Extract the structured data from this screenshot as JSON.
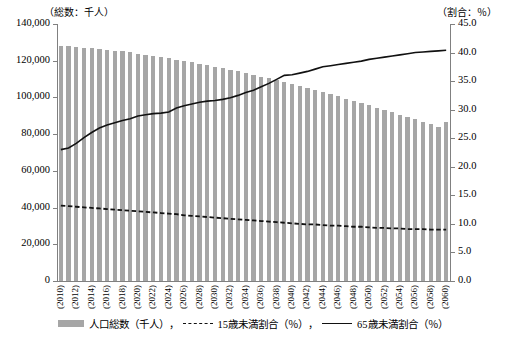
{
  "axes": {
    "left_unit": "（総数：千人）",
    "right_unit": "（割合：％）",
    "left_ticks": [
      "140,000",
      "120,000",
      "100,000",
      "80,000",
      "60,000",
      "40,000",
      "20,000",
      "0"
    ],
    "right_ticks": [
      "45.0",
      "40.0",
      "35.0",
      "30.0",
      "25.0",
      "20.0",
      "15.0",
      "10.0",
      "5.0",
      "0.0"
    ]
  },
  "legend": {
    "items": [
      {
        "label": "人口総数（千人）",
        "marker": "bar-swatch-icon"
      },
      {
        "label": "15歳未満割合（％）",
        "marker": "dashed-line-icon"
      },
      {
        "label": "65歳未満割合（％）",
        "marker": "solid-line-icon"
      }
    ],
    "separator": "，"
  },
  "chart_data": {
    "type": "bar",
    "title": "",
    "xlabel": "",
    "ylabel": "総数：千人",
    "y2label": "割合：％",
    "ylim": [
      0,
      140000
    ],
    "y2lim": [
      0,
      45
    ],
    "grid": false,
    "legend_position": "bottom",
    "x": [
      2010,
      2011,
      2012,
      2013,
      2014,
      2015,
      2016,
      2017,
      2018,
      2019,
      2020,
      2021,
      2022,
      2023,
      2024,
      2025,
      2026,
      2027,
      2028,
      2029,
      2030,
      2031,
      2032,
      2033,
      2034,
      2035,
      2036,
      2037,
      2038,
      2039,
      2040,
      2041,
      2042,
      2043,
      2044,
      2045,
      2046,
      2047,
      2048,
      2049,
      2050,
      2051,
      2052,
      2053,
      2054,
      2055,
      2056,
      2057,
      2058,
      2059,
      2060
    ],
    "tick_labels": [
      "(2010)",
      "(2012)",
      "(2014)",
      "(2016)",
      "(2018)",
      "(2020)",
      "(2022)",
      "(2024)",
      "(2026)",
      "(2028)",
      "(2030)",
      "(2032)",
      "(2034)",
      "(2036)",
      "(2038)",
      "(2040)",
      "(2042)",
      "(2044)",
      "(2046)",
      "(2048)",
      "(2050)",
      "(2052)",
      "(2054)",
      "(2056)",
      "(2058)",
      "(2060)"
    ],
    "series": [
      {
        "name": "人口総数（千人）",
        "type": "bar",
        "axis": "left",
        "color": "#a6a6a6",
        "values": [
          128057,
          127799,
          127515,
          127194,
          126833,
          126434,
          126000,
          125531,
          125028,
          124492,
          123925,
          123327,
          122700,
          122045,
          121363,
          120659,
          119933,
          119186,
          118420,
          117635,
          116818,
          115972,
          115099,
          114199,
          113274,
          112324,
          111351,
          110355,
          109337,
          108299,
          107276,
          106222,
          105140,
          104032,
          102899,
          101743,
          100566,
          99369,
          98154,
          96923,
          95677,
          94418,
          93148,
          91868,
          90580,
          89286,
          87988,
          86687,
          85385,
          84084,
          86737
        ],
        "unit": "千人"
      },
      {
        "name": "15歳未満割合（％）",
        "type": "line",
        "style": "dashed",
        "axis": "right",
        "color": "#111111",
        "values": [
          13.2,
          13.1,
          13.0,
          12.9,
          12.8,
          12.7,
          12.6,
          12.5,
          12.4,
          12.3,
          12.2,
          12.1,
          12.0,
          11.9,
          11.8,
          11.7,
          11.5,
          11.4,
          11.3,
          11.2,
          11.1,
          11.0,
          10.9,
          10.8,
          10.7,
          10.6,
          10.5,
          10.4,
          10.3,
          10.2,
          10.1,
          10.0,
          9.9,
          9.9,
          9.8,
          9.7,
          9.7,
          9.6,
          9.5,
          9.5,
          9.4,
          9.3,
          9.3,
          9.2,
          9.2,
          9.1,
          9.1,
          9.1,
          9.0,
          9.0,
          9.0
        ],
        "unit": "％"
      },
      {
        "name": "65歳未満割合（％）",
        "type": "line",
        "style": "solid",
        "axis": "right",
        "color": "#111111",
        "values": [
          23.0,
          23.3,
          24.1,
          25.1,
          26.0,
          26.8,
          27.3,
          27.7,
          28.1,
          28.4,
          28.9,
          29.1,
          29.3,
          29.4,
          29.6,
          30.3,
          30.7,
          31.0,
          31.3,
          31.5,
          31.6,
          31.8,
          32.1,
          32.5,
          33.0,
          33.4,
          34.0,
          34.6,
          35.3,
          36.0,
          36.1,
          36.4,
          36.7,
          37.1,
          37.5,
          37.7,
          37.9,
          38.1,
          38.3,
          38.5,
          38.8,
          39.0,
          39.2,
          39.4,
          39.6,
          39.8,
          40.0,
          40.1,
          40.2,
          40.3,
          40.4
        ],
        "unit": "％"
      }
    ]
  }
}
